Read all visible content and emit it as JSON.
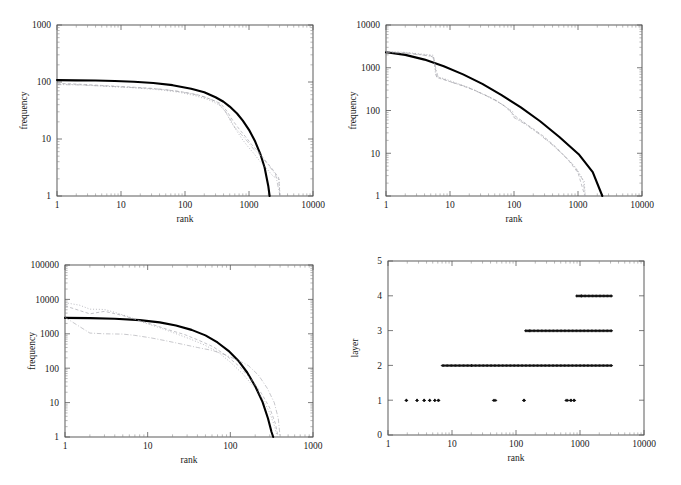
{
  "figure": {
    "title": "",
    "panel_count": 4,
    "background": "#ffffff",
    "fit_color": "#000000"
  },
  "panels": [
    {
      "id": "top-left",
      "name": "panel-top-left",
      "xlabel": "rank",
      "ylabel": "frequency"
    },
    {
      "id": "top-right",
      "name": "panel-top-right",
      "xlabel": "rank",
      "ylabel": "frequency"
    },
    {
      "id": "bottom-left",
      "name": "panel-bottom-left",
      "xlabel": "rank",
      "ylabel": "frequency"
    },
    {
      "id": "bottom-right",
      "name": "panel-bottom-right",
      "xlabel": "rank",
      "ylabel": "layer"
    }
  ],
  "chart_data": [
    {
      "id": "top-left",
      "type": "line",
      "title": "",
      "xlabel": "rank",
      "ylabel": "frequency",
      "xscale": "log",
      "yscale": "log",
      "xlim": [
        1,
        10000
      ],
      "ylim": [
        1,
        1000
      ],
      "xticks": [
        1,
        10,
        100,
        1000,
        10000
      ],
      "xticklabels": [
        "1",
        "10",
        "100",
        "1000",
        "10000"
      ],
      "yticks": [
        1,
        10,
        100,
        1000
      ],
      "yticklabels": [
        "1",
        "10",
        "100",
        "1000"
      ],
      "grid": false,
      "legend": "none",
      "series": [
        {
          "name": "fit",
          "style": "solid-thick",
          "color": "#000000",
          "x": [
            1,
            2,
            4,
            8,
            16,
            32,
            64,
            125,
            200,
            300,
            400,
            500,
            650,
            800,
            1000,
            1250,
            1500,
            1750,
            2000,
            2100
          ],
          "y": [
            108,
            107,
            106,
            104,
            101,
            96,
            88,
            76,
            66,
            54,
            45,
            37,
            28,
            21,
            14.5,
            9.0,
            5.5,
            3.2,
            1.5,
            1.0
          ]
        },
        {
          "name": "sample-1",
          "style": "dotted",
          "color": "#8f8f98",
          "x": [
            1,
            2,
            3,
            5,
            8,
            14,
            25,
            45,
            80,
            140,
            230,
            340,
            430,
            520,
            640,
            780,
            950,
            1200,
            1500,
            1900,
            2400,
            2950,
            3050
          ],
          "y": [
            92,
            90,
            88,
            85,
            82,
            80,
            76,
            72,
            66,
            58,
            49,
            40,
            30,
            20,
            14,
            10,
            7.5,
            5.5,
            4.0,
            3.0,
            2.2,
            2.0,
            1.0
          ]
        },
        {
          "name": "sample-2",
          "style": "dashed",
          "color": "#9a9aa2",
          "x": [
            1,
            2,
            3,
            5,
            9,
            16,
            28,
            50,
            90,
            155,
            250,
            360,
            450,
            560,
            700,
            880,
            1100,
            1400,
            1800,
            2300,
            2900,
            3050
          ],
          "y": [
            95,
            92,
            90,
            87,
            84,
            81,
            78,
            73,
            67,
            60,
            50,
            42,
            31,
            21,
            15,
            11,
            8,
            6,
            4.2,
            3.0,
            2.1,
            1.0
          ]
        },
        {
          "name": "sample-3",
          "style": "dash-dot",
          "color": "#a2a2aa",
          "x": [
            1,
            2,
            4,
            7,
            12,
            22,
            40,
            70,
            120,
            200,
            310,
            400,
            490,
            600,
            760,
            950,
            1200,
            1550,
            2000,
            2600,
            3050
          ],
          "y": [
            90,
            89,
            86,
            84,
            81,
            78,
            75,
            70,
            63,
            55,
            45,
            34,
            24,
            16,
            12,
            9,
            6.5,
            5.0,
            3.5,
            2.4,
            1.0
          ]
        }
      ]
    },
    {
      "id": "top-right",
      "type": "line",
      "title": "",
      "xlabel": "rank",
      "ylabel": "frequency",
      "xscale": "log",
      "yscale": "log",
      "xlim": [
        1,
        10000
      ],
      "ylim": [
        1,
        10000
      ],
      "xticks": [
        1,
        10,
        100,
        1000,
        10000
      ],
      "xticklabels": [
        "1",
        "10",
        "100",
        "1000",
        "10000"
      ],
      "yticks": [
        1,
        10,
        100,
        1000,
        10000
      ],
      "yticklabels": [
        "1",
        "10",
        "100",
        "1000",
        "10000"
      ],
      "grid": false,
      "legend": "none",
      "series": [
        {
          "name": "fit",
          "style": "solid-thick",
          "color": "#000000",
          "x": [
            1,
            2,
            4,
            8,
            16,
            32,
            64,
            128,
            256,
            512,
            1024,
            1700,
            2400
          ],
          "y": [
            2300,
            2000,
            1550,
            1080,
            700,
            420,
            230,
            118,
            56,
            24,
            9.5,
            3.6,
            1.0
          ]
        },
        {
          "name": "sample-1",
          "style": "dotted",
          "color": "#8f8f98",
          "x": [
            1,
            2,
            3,
            5,
            5.5,
            6,
            8,
            12,
            20,
            35,
            60,
            95,
            100,
            160,
            260,
            420,
            680,
            950,
            1250,
            1300
          ],
          "y": [
            2400,
            2300,
            2150,
            2000,
            1950,
            620,
            560,
            450,
            340,
            230,
            150,
            95,
            72,
            46,
            27,
            15,
            7.5,
            4.3,
            2.2,
            1.0
          ]
        },
        {
          "name": "sample-2",
          "style": "dashed",
          "color": "#9a9aa2",
          "x": [
            1,
            2,
            3,
            5,
            5.6,
            6.2,
            9,
            14,
            24,
            42,
            70,
            100,
            170,
            280,
            450,
            700,
            1000,
            1280
          ],
          "y": [
            2350,
            2250,
            2100,
            1900,
            1700,
            590,
            500,
            400,
            300,
            205,
            130,
            78,
            44,
            26,
            14,
            7,
            3.5,
            1.0
          ]
        },
        {
          "name": "sample-3",
          "style": "dash-dot",
          "color": "#a2a2aa",
          "x": [
            1,
            2,
            4,
            5.4,
            6.5,
            10,
            18,
            30,
            52,
            85,
            100,
            150,
            240,
            390,
            620,
            900,
            1200,
            1300
          ],
          "y": [
            2280,
            2180,
            1950,
            1800,
            610,
            470,
            360,
            255,
            175,
            105,
            68,
            48,
            29,
            16,
            8.5,
            4.8,
            2.3,
            1.0
          ]
        }
      ]
    },
    {
      "id": "bottom-left",
      "type": "line",
      "title": "",
      "xlabel": "rank",
      "ylabel": "frequency",
      "xscale": "log",
      "yscale": "log",
      "xlim": [
        1,
        1000
      ],
      "ylim": [
        1,
        100000
      ],
      "xticks": [
        1,
        10,
        100,
        1000
      ],
      "xticklabels": [
        "1",
        "10",
        "100",
        "1000"
      ],
      "yticks": [
        1,
        10,
        100,
        1000,
        10000,
        100000
      ],
      "yticklabels": [
        "1",
        "10",
        "100",
        "1000",
        "10000",
        "100000"
      ],
      "grid": false,
      "legend": "none",
      "series": [
        {
          "name": "fit",
          "style": "solid-thick",
          "color": "#000000",
          "x": [
            1,
            2,
            4,
            8,
            14,
            22,
            34,
            50,
            70,
            95,
            125,
            160,
            200,
            245,
            285,
            315,
            330
          ],
          "y": [
            2900,
            2850,
            2750,
            2500,
            2150,
            1750,
            1300,
            900,
            560,
            320,
            165,
            75,
            30,
            10.5,
            3.5,
            1.4,
            1.0
          ]
        },
        {
          "name": "sample-1",
          "style": "dotted",
          "color": "#8f8f98",
          "x": [
            1,
            1.5,
            2,
            3,
            4,
            6,
            9,
            14,
            21,
            32,
            48,
            70,
            100,
            140,
            190,
            250,
            300,
            340,
            370
          ],
          "y": [
            8000,
            6800,
            5200,
            5100,
            4200,
            3100,
            2100,
            1500,
            1050,
            720,
            480,
            300,
            150,
            70,
            30,
            12,
            5,
            2.2,
            1.0
          ]
        },
        {
          "name": "sample-2",
          "style": "dashed",
          "color": "#9a9aa2",
          "x": [
            1,
            2,
            3,
            5,
            8,
            12,
            18,
            28,
            42,
            62,
            90,
            130,
            180,
            240,
            300,
            350,
            380
          ],
          "y": [
            6500,
            3800,
            4500,
            3400,
            2400,
            1800,
            1300,
            950,
            640,
            420,
            230,
            110,
            46,
            18,
            7,
            2.5,
            1.0
          ]
        },
        {
          "name": "sample-3",
          "style": "dash-dot",
          "color": "#a2a2aa",
          "x": [
            1,
            2,
            3,
            5,
            7,
            11,
            17,
            26,
            40,
            60,
            85,
            120,
            165,
            220,
            280,
            340,
            380,
            400
          ],
          "y": [
            3000,
            1050,
            1000,
            980,
            900,
            760,
            620,
            500,
            400,
            330,
            250,
            175,
            120,
            62,
            26,
            10,
            3.5,
            1.0
          ]
        }
      ]
    },
    {
      "id": "bottom-right",
      "type": "scatter",
      "title": "",
      "xlabel": "rank",
      "ylabel": "layer",
      "xscale": "log",
      "yscale": "linear",
      "xlim": [
        1,
        10000
      ],
      "ylim": [
        0,
        5
      ],
      "xticks": [
        1,
        10,
        100,
        1000,
        10000
      ],
      "xticklabels": [
        "1",
        "10",
        "100",
        "1000",
        "10000"
      ],
      "yticks": [
        0,
        1,
        2,
        3,
        4,
        5
      ],
      "yticklabels": [
        "0",
        "1",
        "2",
        "3",
        "4",
        "5"
      ],
      "grid": false,
      "legend": "none",
      "marker": "+",
      "bands": [
        {
          "layer": 1,
          "xranges": [
            [
              1.9,
              1.95
            ],
            [
              2.8,
              2.85
            ],
            [
              3.6,
              3.7
            ],
            [
              4.4,
              4.5
            ],
            [
              5.3,
              5.4
            ],
            [
              6.0,
              6.2
            ],
            [
              44,
              48
            ],
            [
              130,
              135
            ],
            [
              600,
              640
            ],
            [
              700,
              730
            ],
            [
              790,
              820
            ]
          ]
        },
        {
          "layer": 2,
          "xranges": [
            [
              7,
              20
            ],
            [
              20,
              3100
            ]
          ]
        },
        {
          "layer": 3,
          "xranges": [
            [
              140,
              160
            ],
            [
              160,
              3100
            ]
          ]
        },
        {
          "layer": 4,
          "xranges": [
            [
              880,
              1050
            ],
            [
              1050,
              3100
            ]
          ]
        }
      ]
    }
  ]
}
